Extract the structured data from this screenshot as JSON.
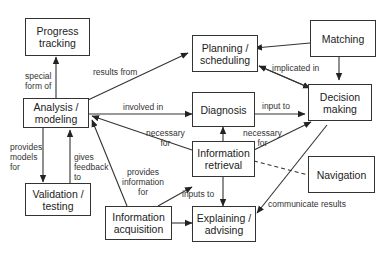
{
  "nodes": {
    "progress": "Progress\ntracking",
    "analysis": "Analysis /\nmodeling",
    "validation": "Validation /\ntesting",
    "planning": "Planning /\nscheduling",
    "diagnosis": "Diagnosis",
    "retrieval": "Information\nretrieval",
    "acquisition": "Information\nacquisition",
    "explaining": "Explaining /\nadvising",
    "matching": "Matching",
    "decision": "Decision\nmaking",
    "navigation": "Navigation"
  },
  "edges": {
    "special_form_of": "special\nform of",
    "results_from": "results from",
    "involved_in": "involved in",
    "provides_models_for": "provides\nmodels\nfor",
    "gives_feedback_to": "gives\nfeedback\nto",
    "implicated_in": "implicated in",
    "input_to": "input to",
    "necessary_for_1": "necessary\nfor",
    "necessary_for_2": "necessary\nfor",
    "provides_information_for": "provides\ninformation\nfor",
    "inputs_to": "inputs to",
    "communicate_results": "communicate results"
  }
}
